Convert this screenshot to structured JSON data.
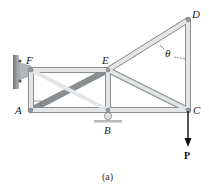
{
  "figure": {
    "caption": "(a)",
    "joints": {
      "A": {
        "label": "A",
        "x": 31,
        "y": 110
      },
      "B": {
        "label": "B",
        "x": 108,
        "y": 110
      },
      "C": {
        "label": "C",
        "x": 188,
        "y": 110
      },
      "D": {
        "label": "D",
        "x": 188,
        "y": 20
      },
      "E": {
        "label": "E",
        "x": 108,
        "y": 70
      },
      "F": {
        "label": "F",
        "x": 31,
        "y": 70
      }
    },
    "members": [
      "FE",
      "AB",
      "BC",
      "FA",
      "EB",
      "DC",
      "ED",
      "FB",
      "EC"
    ],
    "angle_label": "θ",
    "load": {
      "label": "P",
      "direction": "down",
      "at": "C"
    },
    "supports": {
      "F": "pin-wall",
      "B": "roller"
    },
    "colors": {
      "member_fill": "#e3e5e6",
      "member_edge": "#8a8e90",
      "arrow": "#111111",
      "support": "#9a9c9e"
    }
  }
}
